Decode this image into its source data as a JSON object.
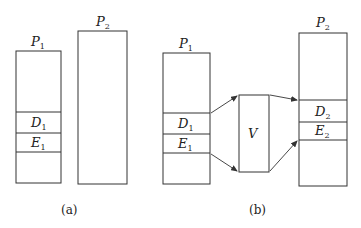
{
  "diagram": {
    "panel_a": {
      "caption": "(a)",
      "p1": {
        "label": "P",
        "sub": "1",
        "segments": [
          {
            "label": "D",
            "sub": "1"
          },
          {
            "label": "E",
            "sub": "1"
          }
        ]
      },
      "p2": {
        "label": "P",
        "sub": "2"
      }
    },
    "panel_b": {
      "caption": "(b)",
      "p1": {
        "label": "P",
        "sub": "1",
        "segments": [
          {
            "label": "D",
            "sub": "1"
          },
          {
            "label": "E",
            "sub": "1"
          }
        ]
      },
      "v": {
        "label": "V"
      },
      "p2": {
        "label": "P",
        "sub": "2",
        "segments": [
          {
            "label": "D",
            "sub": "2"
          },
          {
            "label": "E",
            "sub": "2"
          }
        ]
      }
    },
    "colors": {
      "stroke": "#333333",
      "text": "#222222",
      "background": "#ffffff"
    }
  }
}
